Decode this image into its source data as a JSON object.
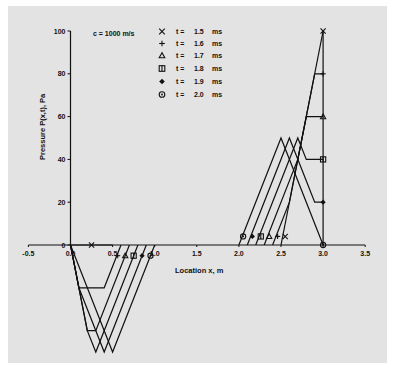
{
  "chart_data": {
    "type": "line",
    "title": "",
    "xlabel": "Location x, m",
    "ylabel": "Pressure P(x,t), Pa",
    "annotation": "c = 1000 m/s",
    "xlim": [
      -0.5,
      3.5
    ],
    "ylim": [
      -50,
      100
    ],
    "xticks": [
      -0.5,
      0.0,
      0.5,
      1.0,
      1.5,
      2.0,
      2.5,
      3.0,
      3.5
    ],
    "xtick_labels": [
      "-0.5",
      "0.0",
      "0.5",
      "1.0",
      "1.5",
      "2.0",
      "2.5",
      "3.0",
      "3.5"
    ],
    "yticks": [
      0,
      20,
      40,
      60,
      80,
      100
    ],
    "ytick_labels": [
      "0",
      "20",
      "40",
      "60",
      "80",
      "100"
    ],
    "grid": false,
    "legend_position": "top-center",
    "wall_line": {
      "x": 3.0,
      "y": [
        0,
        100
      ]
    },
    "series": [
      {
        "name": "t = 1.5 ms",
        "time": "1.5",
        "marker": "x",
        "left": [
          [
            0,
            0
          ],
          [
            0.5,
            0
          ]
        ],
        "right": [
          [
            2.5,
            0
          ],
          [
            3.0,
            100
          ]
        ],
        "markers": [
          [
            0.25,
            0
          ],
          [
            2.55,
            4
          ],
          [
            3.0,
            100
          ]
        ]
      },
      {
        "name": "t = 1.6 ms",
        "time": "1.6",
        "marker": "plus",
        "left": [
          [
            0,
            0
          ],
          [
            0.1,
            -20
          ],
          [
            0.4,
            -20
          ],
          [
            0.6,
            0
          ]
        ],
        "right": [
          [
            2.4,
            0
          ],
          [
            2.6,
            20
          ],
          [
            2.9,
            80
          ],
          [
            3.0,
            80
          ]
        ],
        "markers": [
          [
            0.56,
            -5
          ],
          [
            2.46,
            4
          ],
          [
            3.0,
            80
          ]
        ]
      },
      {
        "name": "t = 1.7 ms",
        "time": "1.7",
        "marker": "triangle",
        "left": [
          [
            0,
            0
          ],
          [
            0.2,
            -40
          ],
          [
            0.3,
            -40
          ],
          [
            0.7,
            0
          ]
        ],
        "right": [
          [
            2.3,
            0
          ],
          [
            2.7,
            40
          ],
          [
            2.8,
            60
          ],
          [
            3.0,
            60
          ]
        ],
        "markers": [
          [
            0.65,
            -5
          ],
          [
            2.36,
            4
          ],
          [
            3.0,
            60
          ]
        ]
      },
      {
        "name": "t = 1.8 ms",
        "time": "1.8",
        "marker": "square",
        "left": [
          [
            0,
            0
          ],
          [
            0.2,
            -40
          ],
          [
            0.3,
            -50
          ],
          [
            0.8,
            0
          ]
        ],
        "right": [
          [
            2.2,
            0
          ],
          [
            2.7,
            50
          ],
          [
            2.8,
            40
          ],
          [
            3.0,
            40
          ]
        ],
        "markers": [
          [
            0.75,
            -5
          ],
          [
            2.26,
            4
          ],
          [
            3.0,
            40
          ]
        ]
      },
      {
        "name": "t = 1.9 ms",
        "time": "1.9",
        "marker": "diamond",
        "left": [
          [
            0,
            0
          ],
          [
            0.1,
            -20
          ],
          [
            0.4,
            -50
          ],
          [
            0.9,
            0
          ]
        ],
        "right": [
          [
            2.1,
            0
          ],
          [
            2.6,
            50
          ],
          [
            2.9,
            20
          ],
          [
            3.0,
            20
          ]
        ],
        "markers": [
          [
            0.85,
            -5
          ],
          [
            2.16,
            4
          ],
          [
            3.0,
            20
          ]
        ]
      },
      {
        "name": "t = 2.0 ms",
        "time": "2.0",
        "marker": "circle",
        "left": [
          [
            0,
            0
          ],
          [
            0.5,
            -50
          ],
          [
            1.0,
            0
          ]
        ],
        "right": [
          [
            2.0,
            0
          ],
          [
            2.5,
            50
          ],
          [
            3.0,
            0
          ]
        ],
        "markers": [
          [
            0.95,
            -5
          ],
          [
            2.05,
            4
          ],
          [
            3.0,
            0
          ]
        ]
      }
    ]
  },
  "legend": {
    "t_prefix": "t =",
    "unit": "ms"
  },
  "colors": {
    "panel_bg": "#e3e3e3",
    "ink": "#111111"
  }
}
